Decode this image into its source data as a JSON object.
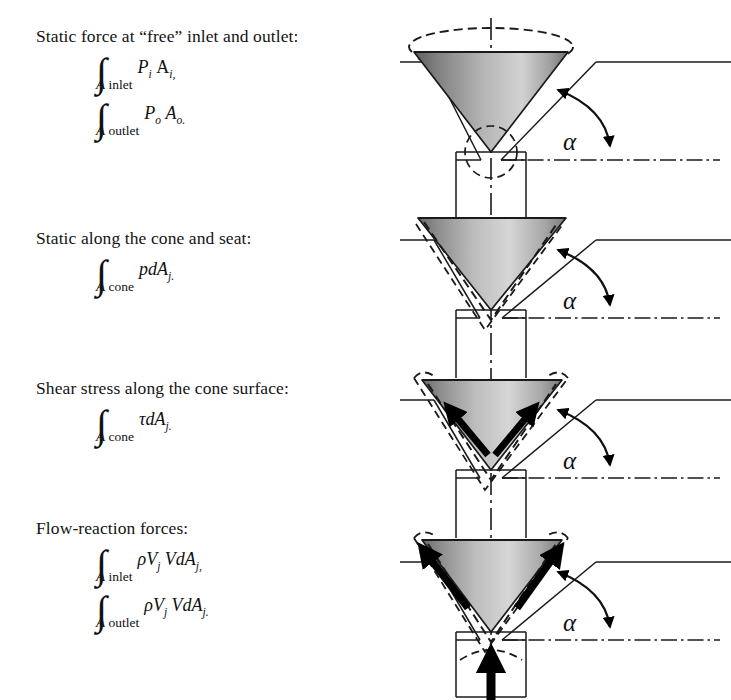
{
  "figure": {
    "angle_symbol": "α",
    "colors": {
      "line": "#1a1a1a",
      "cone_dark": "#6f6f6f",
      "cone_mid": "#9d9d9d",
      "cone_light": "#d8d8d8",
      "arrow": "#000000",
      "background": "#ffffff"
    }
  },
  "blocks": [
    {
      "id": "static-force-free",
      "caption": "Static force at “free” inlet and outlet:",
      "equations": [
        {
          "integral": "∫",
          "limit_A": "A",
          "limit_sub": "inlet",
          "integrand_pre": "P",
          "integrand_pre_sub": "i",
          "integrand_post": "A",
          "integrand_post_sub": "i,"
        },
        {
          "integral": "∫",
          "limit_A": "A",
          "limit_sub": "outlet",
          "integrand_pre": "P",
          "integrand_pre_sub": "o",
          "integrand_post": "A",
          "integrand_post_sub": "o."
        }
      ],
      "diagram": {
        "name": "cone-valve-static-free",
        "shear_arrows": false,
        "flow_arrows": false,
        "inlet_arrow": false,
        "dashed_cone_outline": "ellipse",
        "angle_label": "α"
      }
    },
    {
      "id": "static-cone-seat",
      "caption": "Static along the cone and seat:",
      "equations": [
        {
          "integral": "∫",
          "limit_A": "A",
          "limit_sub": "cone",
          "integrand_pre": "pdA",
          "integrand_pre_sub": "j.",
          "integrand_post": "",
          "integrand_post_sub": ""
        }
      ],
      "diagram": {
        "name": "cone-valve-static-cone-seat",
        "shear_arrows": false,
        "flow_arrows": false,
        "inlet_arrow": false,
        "dashed_cone_outline": "surface",
        "angle_label": "α"
      }
    },
    {
      "id": "shear-stress",
      "caption": "Shear stress along the cone surface:",
      "equations": [
        {
          "integral": "∫",
          "limit_A": "A",
          "limit_sub": "cone",
          "integrand_pre": "τdA",
          "integrand_pre_sub": "j.",
          "integrand_post": "",
          "integrand_post_sub": ""
        }
      ],
      "diagram": {
        "name": "cone-valve-shear-stress",
        "shear_arrows": true,
        "flow_arrows": false,
        "inlet_arrow": false,
        "dashed_cone_outline": "surface",
        "angle_label": "α"
      }
    },
    {
      "id": "flow-reaction",
      "caption": "Flow-reaction forces:",
      "equations": [
        {
          "integral": "∫",
          "limit_A": "A",
          "limit_sub": "inlet",
          "integrand_pre": "ρV",
          "integrand_pre_sub": "j",
          "integrand_post": "VdA",
          "integrand_post_sub": "j,"
        },
        {
          "integral": "∫",
          "limit_A": "A",
          "limit_sub": "outlet",
          "integrand_pre": "ρV",
          "integrand_pre_sub": "j",
          "integrand_post": "VdA",
          "integrand_post_sub": "j."
        }
      ],
      "diagram": {
        "name": "cone-valve-flow-reaction",
        "shear_arrows": false,
        "flow_arrows": true,
        "inlet_arrow": true,
        "dashed_cone_outline": "surface",
        "angle_label": "α"
      }
    }
  ]
}
